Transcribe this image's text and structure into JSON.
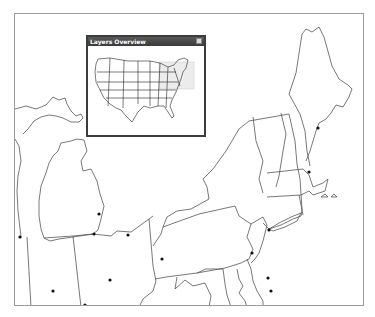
{
  "overview": {
    "title": "Layers Overview",
    "close_icon": "close-icon",
    "extent_box_color": "#e4e4e4"
  },
  "map": {
    "region": "Great Lakes / Northeast United States",
    "line_color": "#555555",
    "frame_color": "#9a9a9a",
    "city_color": "#111111",
    "city_points": [
      {
        "x": 19,
        "y": 236
      },
      {
        "x": 93,
        "y": 233
      },
      {
        "x": 98,
        "y": 213
      },
      {
        "x": 127,
        "y": 234
      },
      {
        "x": 161,
        "y": 258
      },
      {
        "x": 109,
        "y": 279
      },
      {
        "x": 52,
        "y": 290
      },
      {
        "x": 84,
        "y": 304
      },
      {
        "x": 163,
        "y": 257
      },
      {
        "x": 251,
        "y": 252
      },
      {
        "x": 267,
        "y": 277
      },
      {
        "x": 270,
        "y": 290
      },
      {
        "x": 268,
        "y": 229
      },
      {
        "x": 308,
        "y": 171
      },
      {
        "x": 317,
        "y": 127
      }
    ]
  }
}
